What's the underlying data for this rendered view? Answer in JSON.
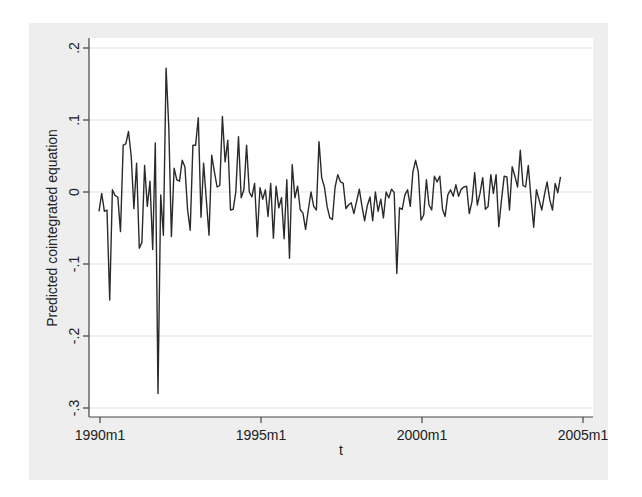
{
  "chart_data": {
    "type": "line",
    "title": "",
    "xlabel": "t",
    "ylabel": "Predicted cointegrated equation",
    "x_start": "1990m1",
    "x_end": "2003m12",
    "frequency": "monthly",
    "xlim": [
      "1990m1",
      "2005m1"
    ],
    "ylim": [
      -0.3,
      0.2
    ],
    "x_ticks": [
      "1990m1",
      "1995m1",
      "2000m1",
      "2005m1"
    ],
    "y_ticks": [
      ".2",
      ".1",
      "0",
      "-.1",
      "-.2",
      "-.3"
    ],
    "y_tick_values": [
      0.2,
      0.1,
      0,
      -0.1,
      -0.2,
      -0.3
    ],
    "grid": "horizontal",
    "legend": "none",
    "series": [
      {
        "name": "Predicted cointegrated equation",
        "color": "#2a2a2a",
        "values": [
          -0.027,
          -0.002,
          -0.027,
          -0.025,
          -0.15,
          0.003,
          -0.005,
          -0.007,
          -0.055,
          0.065,
          0.067,
          0.084,
          0.05,
          -0.023,
          0.04,
          -0.078,
          -0.07,
          0.037,
          -0.02,
          0.015,
          -0.08,
          0.068,
          -0.28,
          -0.004,
          -0.06,
          0.172,
          0.09,
          -0.062,
          0.033,
          0.017,
          0.015,
          0.044,
          0.035,
          -0.025,
          -0.053,
          0.065,
          0.065,
          0.103,
          -0.035,
          0.04,
          -0.01,
          -0.06,
          0.051,
          0.028,
          0.007,
          0.009,
          0.105,
          0.042,
          0.072,
          -0.025,
          -0.024,
          0.0,
          0.077,
          -0.008,
          0.003,
          0.065,
          0.0,
          -0.007,
          0.012,
          -0.062,
          0.006,
          -0.01,
          0.003,
          -0.034,
          0.012,
          -0.064,
          0.008,
          -0.022,
          -0.008,
          -0.065,
          0.017,
          -0.092,
          0.038,
          -0.008,
          0.008,
          -0.025,
          -0.029,
          -0.052,
          -0.025,
          0.0,
          -0.02,
          -0.025,
          0.07,
          0.02,
          0.007,
          -0.02,
          -0.036,
          -0.038,
          0.007,
          0.024,
          0.014,
          0.012,
          -0.023,
          -0.018,
          -0.015,
          -0.03,
          -0.013,
          0.004,
          -0.02,
          -0.04,
          -0.019,
          -0.007,
          -0.04,
          0.0,
          -0.027,
          -0.01,
          -0.036,
          0.0,
          -0.008,
          0.004,
          -0.001,
          -0.113,
          -0.022,
          -0.024,
          -0.004,
          0.003,
          -0.02,
          0.028,
          0.044,
          0.028,
          -0.039,
          -0.032,
          0.017,
          -0.018,
          -0.025,
          0.022,
          0.014,
          0.022,
          -0.024,
          -0.034,
          -0.004,
          0.003,
          -0.006,
          0.01,
          -0.006,
          0.004,
          0.007,
          0.008,
          -0.03,
          -0.013,
          0.027,
          -0.018,
          -0.002,
          0.02,
          -0.024,
          -0.02,
          0.024,
          -0.002,
          0.024,
          -0.048,
          -0.011,
          0.022,
          0.021,
          -0.025,
          0.035,
          0.022,
          0.007,
          0.058,
          0.009,
          0.007,
          0.037,
          -0.009,
          -0.049,
          0.003,
          -0.011,
          -0.025,
          -0.004,
          0.014,
          -0.011,
          -0.025,
          0.012,
          -0.001,
          0.021
        ]
      }
    ]
  },
  "layout": {
    "outer_panel_color": "#eeeeee",
    "plot_bg_color": "#ffffff",
    "grid_color": "#e3e3e3",
    "axis_color": "#444444"
  }
}
